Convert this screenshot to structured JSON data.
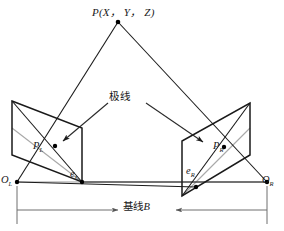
{
  "figure": {
    "background_color": "#ffffff",
    "line_color": "#1a1a1a",
    "gray_line_color": "#9a9a9a",
    "point_color": "#000000"
  },
  "labels": {
    "world_point": "P(X， Y， Z)",
    "epipolar_line": "极线",
    "baseline_text": "基线",
    "baseline_symbol": "B",
    "left_image_point": "P",
    "left_image_point_sub": "L",
    "right_image_point": "P",
    "right_image_point_sub": "R",
    "left_epipole": "e",
    "left_epipole_sub": "L",
    "right_epipole": "e",
    "right_epipole_sub": "R",
    "left_center": "O",
    "left_center_sub": "L",
    "right_center": "O",
    "right_center_sub": "R"
  },
  "geometry": {
    "world_point_xy": [
      118,
      22
    ],
    "left_center_xy": [
      17,
      182
    ],
    "right_center_xy": [
      267,
      182
    ],
    "left_epipole_xy": [
      82,
      182
    ],
    "right_epipole_xy": [
      196,
      187
    ],
    "left_image_point_xy": [
      55,
      146
    ],
    "right_image_point_xy": [
      224,
      147
    ],
    "left_plane_corners": [
      [
        12,
        101
      ],
      [
        82,
        128
      ],
      [
        82,
        182
      ],
      [
        12,
        155
      ]
    ],
    "right_plane_corners": [
      [
        250,
        103
      ],
      [
        250,
        155
      ],
      [
        182,
        196
      ],
      [
        182,
        141
      ]
    ],
    "baseline_dimension_y": 210,
    "baseline_label_gap": [
      120,
      180
    ]
  },
  "icons": {
    "arrow_pointer_left": "arrow-down-left-icon",
    "arrow_pointer_right": "arrow-down-right-icon",
    "dimension_arrow_left": "arrow-right-icon",
    "dimension_arrow_right": "arrow-left-icon"
  }
}
